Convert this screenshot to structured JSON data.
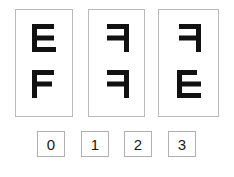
{
  "puzzle": {
    "type": "visual-analogy-glyph-panels",
    "background_color": "#ffffff",
    "panel_border_color": "#b9b9b9",
    "glyph_color": "#111111",
    "choice_border_color": "#b0b0b0",
    "choice_text_color": "#1a1a1a",
    "panels": [
      {
        "name": "panel-1",
        "x": 15,
        "y": 9,
        "width": 58,
        "height": 108,
        "glyphs": [
          {
            "slot": "top",
            "name": "glyph-tieut",
            "shape": "tieut",
            "description": "left vertical stem with top, middle and bottom horizontal bars extending right"
          },
          {
            "slot": "bottom",
            "name": "glyph-f",
            "shape": "ef",
            "description": "left vertical stem with top and middle horizontal bars extending right"
          }
        ]
      },
      {
        "name": "panel-2",
        "x": 88,
        "y": 9,
        "width": 57,
        "height": 108,
        "glyphs": [
          {
            "slot": "top",
            "name": "glyph-kieuk",
            "shape": "kieuk",
            "description": "right vertical stem with top and middle horizontal bars extending left"
          },
          {
            "slot": "bottom",
            "name": "glyph-kieuk",
            "shape": "kieuk",
            "description": "right vertical stem with top and middle horizontal bars extending left"
          }
        ]
      },
      {
        "name": "panel-3",
        "x": 158,
        "y": 9,
        "width": 61,
        "height": 108,
        "glyphs": [
          {
            "slot": "top",
            "name": "glyph-kieuk",
            "shape": "kieuk",
            "description": "right vertical stem with top and middle horizontal bars extending left"
          },
          {
            "slot": "bottom",
            "name": "glyph-tieut",
            "shape": "tieut",
            "description": "left vertical stem with top, middle and bottom horizontal bars extending right"
          }
        ]
      }
    ],
    "choices": [
      {
        "label": "0",
        "x": 37
      },
      {
        "label": "1",
        "x": 81
      },
      {
        "label": "2",
        "x": 124
      },
      {
        "label": "3",
        "x": 168
      }
    ]
  }
}
